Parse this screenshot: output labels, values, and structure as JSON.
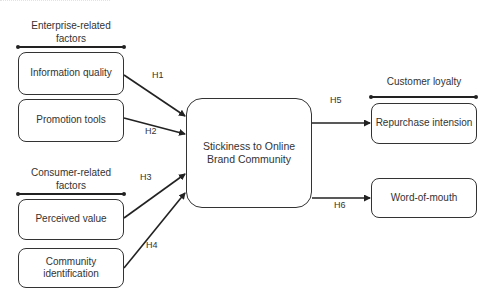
{
  "diagram": {
    "type": "research-model",
    "groups": [
      {
        "id": "enterprise",
        "label_line1": "Enterprise-related",
        "label_line2": "factors"
      },
      {
        "id": "consumer",
        "label_line1": "Consumer-related",
        "label_line2": "factors"
      },
      {
        "id": "loyalty",
        "label_line1": "Customer loyalty",
        "label_line2": ""
      }
    ],
    "nodes": {
      "information_quality": {
        "line1": "Information quality",
        "line2": ""
      },
      "promotion_tools": {
        "line1": "Promotion tools",
        "line2": ""
      },
      "perceived_value": {
        "line1": "Perceived value",
        "line2": ""
      },
      "community_identification": {
        "line1": "Community",
        "line2": "identification"
      },
      "stickiness": {
        "line1": "Stickiness to Online",
        "line2": "Brand Community"
      },
      "repurchase_intension": {
        "line1": "Repurchase intension",
        "line2": ""
      },
      "word_of_mouth": {
        "line1": "Word-of-mouth",
        "line2": ""
      }
    },
    "hypotheses": [
      {
        "id": "H1",
        "label": "H1",
        "from": "information_quality",
        "to": "stickiness"
      },
      {
        "id": "H2",
        "label": "H2",
        "from": "promotion_tools",
        "to": "stickiness"
      },
      {
        "id": "H3",
        "label": "H3",
        "from": "perceived_value",
        "to": "stickiness"
      },
      {
        "id": "H4",
        "label": "H4",
        "from": "community_identification",
        "to": "stickiness"
      },
      {
        "id": "H5",
        "label": "H5",
        "from": "stickiness",
        "to": "repurchase_intension"
      },
      {
        "id": "H6",
        "label": "H6",
        "from": "stickiness",
        "to": "word_of_mouth"
      }
    ],
    "colors": {
      "stroke": "#333333",
      "background": "#ffffff",
      "text": "#333333"
    }
  }
}
